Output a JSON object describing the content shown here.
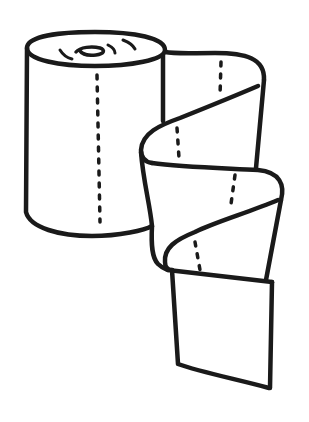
{
  "illustration": {
    "subject": "paper towel roll",
    "style": "black line art on white",
    "stroke_color": "#1a1a1a",
    "background_color": "#ffffff",
    "parts": [
      "roll-top",
      "roll-body",
      "unrolled-sheet-upper",
      "unrolled-sheet-middle",
      "unrolled-sheet-lower",
      "perforation-lines"
    ]
  }
}
